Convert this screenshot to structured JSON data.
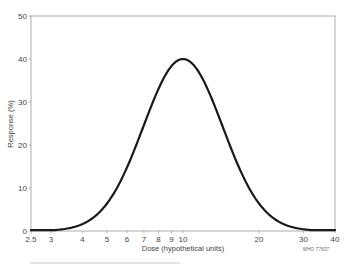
{
  "chart_data": {
    "type": "line",
    "title": "",
    "xlabel": "Dose (hypothetical units)",
    "ylabel": "Response (%)",
    "xscale": "log",
    "xlim": [
      2.5,
      40
    ],
    "ylim": [
      0,
      50
    ],
    "x_ticks": [
      2.5,
      3,
      4,
      5,
      6,
      7,
      8,
      9,
      10,
      20,
      30,
      40
    ],
    "x_tick_labels": [
      "2.5",
      "3",
      "4",
      "5",
      "6",
      "7",
      "8",
      "9",
      "10",
      "20",
      "30",
      "40"
    ],
    "y_ticks": [
      0,
      10,
      20,
      30,
      40,
      50
    ],
    "y_tick_labels": [
      "0",
      "10",
      "20",
      "30",
      "40",
      "50"
    ],
    "grid": false,
    "legend": null,
    "series": [
      {
        "name": "Dose-response curve",
        "x": [
          2.5,
          3,
          3.5,
          4,
          4.5,
          5,
          6,
          7,
          8,
          9,
          10,
          11,
          12,
          14,
          16,
          18,
          20,
          25,
          30,
          35,
          40
        ],
        "values": [
          0.1,
          0.4,
          1.0,
          2.3,
          4.2,
          6.4,
          12.6,
          20.1,
          27.6,
          34.1,
          40.0,
          38.6,
          35.7,
          27.6,
          19.5,
          13.0,
          6.4,
          2.2,
          0.6,
          0.2,
          0.1
        ]
      }
    ],
    "peak": {
      "x": 10,
      "y": 40
    },
    "annotations": [
      "WHO 77637"
    ]
  },
  "labels": {
    "ylabel": "Response (%)",
    "xlabel": "Dose (hypothetical units)",
    "code": "WHO 77637"
  }
}
